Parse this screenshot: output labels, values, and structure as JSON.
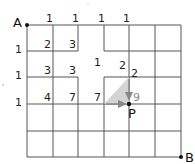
{
  "diagram": {
    "type": "grid-path-counting",
    "colors": {
      "line": "#555555",
      "text": "#222222",
      "highlight": "#888888",
      "shade": "#d4d4d4"
    },
    "points": {
      "A": {
        "label": "A",
        "x": 27,
        "y": 25
      },
      "B": {
        "label": "B",
        "x": 181,
        "y": 157
      },
      "P": {
        "label": "P",
        "x": 129,
        "y": 104
      }
    },
    "grid": {
      "x": [
        27,
        53,
        78,
        104,
        129,
        155,
        181
      ],
      "y": [
        25,
        51,
        77,
        104,
        131,
        157
      ]
    },
    "labels": [
      {
        "text": "1",
        "x": 46,
        "y": 13
      },
      {
        "text": "1",
        "x": 72,
        "y": 13
      },
      {
        "text": "1",
        "x": 98,
        "y": 13
      },
      {
        "text": "1",
        "x": 123,
        "y": 13
      },
      {
        "text": "1",
        "x": 15,
        "y": 49
      },
      {
        "text": "2",
        "x": 46,
        "y": 40
      },
      {
        "text": "3",
        "x": 72,
        "y": 40
      },
      {
        "text": "1",
        "x": 15,
        "y": 75
      },
      {
        "text": "3",
        "x": 46,
        "y": 66
      },
      {
        "text": "3",
        "x": 72,
        "y": 66
      },
      {
        "text": "1",
        "x": 97,
        "y": 57
      },
      {
        "text": "2",
        "x": 122,
        "y": 60
      },
      {
        "text": "2",
        "x": 132,
        "y": 68
      },
      {
        "text": "1",
        "x": 15,
        "y": 102
      },
      {
        "text": "4",
        "x": 46,
        "y": 93
      },
      {
        "text": "7",
        "x": 72,
        "y": 93
      },
      {
        "text": "7",
        "x": 97,
        "y": 93
      }
    ],
    "highlight_label": {
      "text": "9",
      "x": 134,
      "y": 92
    }
  }
}
